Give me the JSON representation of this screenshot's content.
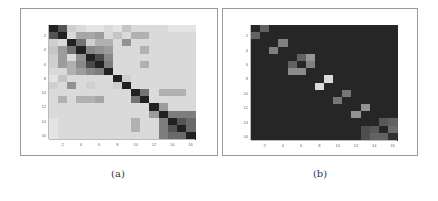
{
  "captions": {
    "a": "(a)",
    "b": "(b)"
  },
  "chart_data": [
    {
      "type": "heatmap",
      "title": "(a)",
      "colormap": "gray (dark = high)",
      "x_ticks": [
        "2",
        "4",
        "6",
        "8",
        "10",
        "12",
        "14",
        "16"
      ],
      "y_ticks": [
        "2",
        "4",
        "6",
        "8",
        "10",
        "12",
        "14",
        "16"
      ],
      "size": 16,
      "values": [
        [
          1.0,
          0.75,
          0.15,
          0.1,
          0.05,
          0.05,
          0.1,
          0.05,
          0.2,
          0.1,
          0.1,
          0.1,
          0.1,
          0.05,
          0.05,
          0.05
        ],
        [
          0.75,
          1.0,
          0.1,
          0.35,
          0.35,
          0.4,
          0.1,
          0.2,
          0.1,
          0.3,
          0.3,
          0.1,
          0.1,
          0.1,
          0.1,
          0.1
        ],
        [
          0.15,
          0.1,
          1.0,
          0.6,
          0.15,
          0.3,
          0.3,
          0.1,
          0.45,
          0.1,
          0.1,
          0.1,
          0.1,
          0.1,
          0.1,
          0.1
        ],
        [
          0.2,
          0.4,
          0.6,
          1.0,
          0.5,
          0.45,
          0.4,
          0.1,
          0.1,
          0.1,
          0.3,
          0.1,
          0.1,
          0.1,
          0.1,
          0.1
        ],
        [
          0.15,
          0.4,
          0.1,
          0.45,
          1.0,
          0.8,
          0.5,
          0.1,
          0.1,
          0.1,
          0.1,
          0.1,
          0.1,
          0.1,
          0.1,
          0.1
        ],
        [
          0.15,
          0.4,
          0.3,
          0.5,
          0.8,
          1.0,
          0.55,
          0.1,
          0.1,
          0.1,
          0.3,
          0.1,
          0.1,
          0.1,
          0.1,
          0.1
        ],
        [
          0.1,
          0.1,
          0.3,
          0.4,
          0.5,
          0.55,
          1.0,
          0.1,
          0.1,
          0.1,
          0.1,
          0.1,
          0.1,
          0.1,
          0.1,
          0.1
        ],
        [
          0.05,
          0.2,
          0.1,
          0.1,
          0.1,
          0.1,
          0.1,
          1.0,
          0.15,
          0.1,
          0.1,
          0.1,
          0.1,
          0.1,
          0.1,
          0.1
        ],
        [
          0.15,
          0.1,
          0.45,
          0.1,
          0.15,
          0.1,
          0.1,
          0.15,
          1.0,
          0.1,
          0.1,
          0.1,
          0.1,
          0.1,
          0.1,
          0.1
        ],
        [
          0.1,
          0.1,
          0.1,
          0.1,
          0.1,
          0.1,
          0.1,
          0.1,
          0.1,
          1.0,
          0.6,
          0.1,
          0.3,
          0.3,
          0.3,
          0.1
        ],
        [
          0.1,
          0.3,
          0.1,
          0.3,
          0.3,
          0.35,
          0.1,
          0.1,
          0.1,
          0.6,
          1.0,
          0.1,
          0.1,
          0.1,
          0.1,
          0.1
        ],
        [
          0.1,
          0.1,
          0.1,
          0.1,
          0.1,
          0.1,
          0.1,
          0.1,
          0.1,
          0.1,
          0.1,
          1.0,
          0.4,
          0.1,
          0.1,
          0.1
        ],
        [
          0.1,
          0.1,
          0.1,
          0.1,
          0.1,
          0.1,
          0.1,
          0.1,
          0.1,
          0.1,
          0.1,
          0.4,
          1.0,
          0.55,
          0.55,
          0.55
        ],
        [
          0.05,
          0.1,
          0.1,
          0.1,
          0.1,
          0.1,
          0.1,
          0.1,
          0.1,
          0.3,
          0.1,
          0.1,
          0.55,
          1.0,
          0.75,
          0.65
        ],
        [
          0.05,
          0.1,
          0.1,
          0.1,
          0.1,
          0.1,
          0.1,
          0.1,
          0.1,
          0.3,
          0.1,
          0.1,
          0.55,
          0.75,
          1.0,
          0.65
        ],
        [
          0.05,
          0.1,
          0.1,
          0.1,
          0.1,
          0.1,
          0.1,
          0.1,
          0.1,
          0.1,
          0.1,
          0.1,
          0.55,
          0.65,
          0.65,
          1.0
        ]
      ]
    },
    {
      "type": "heatmap",
      "title": "(b)",
      "colormap": "gray (bright = high)",
      "x_ticks": [
        "2",
        "4",
        "6",
        "8",
        "10",
        "12",
        "14",
        "16"
      ],
      "y_ticks": [
        "2",
        "4",
        "6",
        "8",
        "10",
        "12",
        "14",
        "16"
      ],
      "size": 16,
      "values": [
        [
          0,
          0.3,
          0,
          0,
          0,
          0,
          0,
          0,
          0,
          0,
          0,
          0,
          0,
          0,
          0,
          0
        ],
        [
          0.3,
          0,
          0,
          0,
          0,
          0,
          0,
          0,
          0,
          0,
          0,
          0,
          0,
          0,
          0,
          0
        ],
        [
          0,
          0,
          0,
          0.45,
          0,
          0,
          0,
          0,
          0,
          0,
          0,
          0,
          0,
          0,
          0,
          0
        ],
        [
          0,
          0,
          0.45,
          0,
          0,
          0,
          0,
          0,
          0,
          0,
          0,
          0,
          0,
          0,
          0,
          0
        ],
        [
          0,
          0,
          0,
          0,
          0,
          0.3,
          0.55,
          0,
          0,
          0,
          0,
          0,
          0,
          0,
          0,
          0
        ],
        [
          0,
          0,
          0,
          0,
          0.3,
          0,
          0.45,
          0,
          0,
          0,
          0,
          0,
          0,
          0,
          0,
          0
        ],
        [
          0,
          0,
          0,
          0,
          0.5,
          0.5,
          0,
          0,
          0,
          0,
          0,
          0,
          0,
          0,
          0,
          0
        ],
        [
          0,
          0,
          0,
          0,
          0,
          0,
          0,
          0,
          0.9,
          0,
          0,
          0,
          0,
          0,
          0,
          0
        ],
        [
          0,
          0,
          0,
          0,
          0,
          0,
          0,
          0.9,
          0,
          0,
          0,
          0,
          0,
          0,
          0,
          0
        ],
        [
          0,
          0,
          0,
          0,
          0,
          0,
          0,
          0,
          0,
          0,
          0.4,
          0,
          0,
          0,
          0,
          0
        ],
        [
          0,
          0,
          0,
          0,
          0,
          0,
          0,
          0,
          0,
          0.4,
          0,
          0,
          0,
          0,
          0,
          0
        ],
        [
          0,
          0,
          0,
          0,
          0,
          0,
          0,
          0,
          0,
          0,
          0,
          0,
          0.55,
          0,
          0,
          0
        ],
        [
          0,
          0,
          0,
          0,
          0,
          0,
          0,
          0,
          0,
          0,
          0,
          0.55,
          0,
          0,
          0,
          0
        ],
        [
          0,
          0,
          0,
          0,
          0,
          0,
          0,
          0,
          0,
          0,
          0,
          0,
          0,
          0,
          0.25,
          0.3
        ],
        [
          0,
          0,
          0,
          0,
          0,
          0,
          0,
          0,
          0,
          0,
          0,
          0,
          0.2,
          0.25,
          0,
          0.35
        ],
        [
          0,
          0,
          0,
          0,
          0,
          0,
          0,
          0,
          0,
          0,
          0,
          0,
          0.2,
          0.3,
          0.3,
          0.05
        ]
      ]
    }
  ]
}
